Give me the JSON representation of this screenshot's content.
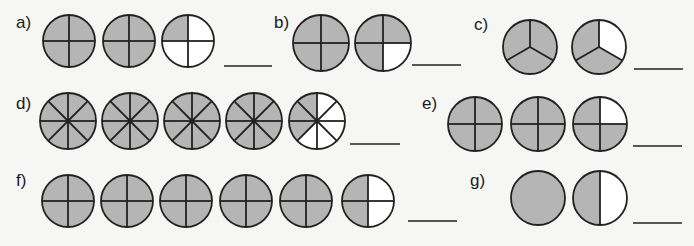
{
  "worksheet": {
    "colors": {
      "background": "#f6f6f4",
      "shaded": "#b5b5b5",
      "unshaded": "#ffffff",
      "line": "#222222"
    },
    "problems": [
      {
        "label": "a)",
        "label_pos": [
          16,
          14
        ],
        "radius": 26,
        "cy": 41,
        "circles": [
          {
            "cx": 69,
            "parts": 4,
            "shaded": [
              0,
              1,
              2,
              3
            ]
          },
          {
            "cx": 129,
            "parts": 4,
            "shaded": [
              0,
              1,
              2,
              3
            ]
          },
          {
            "cx": 188,
            "parts": 4,
            "shaded": [
              3
            ]
          }
        ],
        "answer_line": {
          "x1": 224,
          "x2": 272,
          "y": 66
        },
        "answer": ""
      },
      {
        "label": "b)",
        "label_pos": [
          274,
          14
        ],
        "radius": 28,
        "cy": 43,
        "circles": [
          {
            "cx": 321,
            "parts": 4,
            "shaded": [
              0,
              1,
              2,
              3
            ]
          },
          {
            "cx": 383,
            "parts": 4,
            "shaded": [
              0,
              2,
              3
            ]
          }
        ],
        "answer_line": {
          "x1": 412,
          "x2": 461,
          "y": 65
        },
        "answer": ""
      },
      {
        "label": "c)",
        "label_pos": [
          474,
          16
        ],
        "radius": 27,
        "cy": 47,
        "circles": [
          {
            "cx": 530,
            "parts": 3,
            "shaded": [
              0,
              1,
              2
            ]
          },
          {
            "cx": 599,
            "parts": 3,
            "shaded": [
              1,
              2
            ]
          }
        ],
        "answer_line": {
          "x1": 634,
          "x2": 683,
          "y": 69
        },
        "answer": ""
      },
      {
        "label": "d)",
        "label_pos": [
          16,
          95
        ],
        "radius": 28,
        "cy": 121,
        "circles": [
          {
            "cx": 68,
            "parts": 8,
            "shaded": [
              0,
              1,
              2,
              3,
              4,
              5,
              6,
              7
            ]
          },
          {
            "cx": 130,
            "parts": 8,
            "shaded": [
              0,
              1,
              2,
              3,
              4,
              5,
              6,
              7
            ]
          },
          {
            "cx": 192,
            "parts": 8,
            "shaded": [
              0,
              1,
              2,
              3,
              4,
              5,
              6,
              7
            ]
          },
          {
            "cx": 254,
            "parts": 8,
            "shaded": [
              0,
              1,
              2,
              3,
              4,
              5,
              6,
              7
            ]
          },
          {
            "cx": 317,
            "parts": 8,
            "shaded": [
              5,
              6,
              7
            ]
          }
        ],
        "answer_line": {
          "x1": 350,
          "x2": 400,
          "y": 144
        },
        "answer": ""
      },
      {
        "label": "e)",
        "label_pos": [
          422,
          95
        ],
        "radius": 27,
        "cy": 124,
        "circles": [
          {
            "cx": 475,
            "parts": 4,
            "shaded": [
              0,
              1,
              2,
              3
            ]
          },
          {
            "cx": 538,
            "parts": 4,
            "shaded": [
              0,
              1,
              2,
              3
            ]
          },
          {
            "cx": 600,
            "parts": 4,
            "shaded": [
              1,
              2,
              3
            ]
          }
        ],
        "answer_line": {
          "x1": 633,
          "x2": 682,
          "y": 146
        },
        "answer": ""
      },
      {
        "label": "f)",
        "label_pos": [
          16,
          172
        ],
        "radius": 26,
        "cy": 201,
        "circles": [
          {
            "cx": 68,
            "parts": 4,
            "shaded": [
              0,
              1,
              2,
              3
            ]
          },
          {
            "cx": 127,
            "parts": 4,
            "shaded": [
              0,
              1,
              2,
              3
            ]
          },
          {
            "cx": 186,
            "parts": 4,
            "shaded": [
              0,
              1,
              2,
              3
            ]
          },
          {
            "cx": 246,
            "parts": 4,
            "shaded": [
              0,
              1,
              2,
              3
            ]
          },
          {
            "cx": 306,
            "parts": 4,
            "shaded": [
              0,
              1,
              2,
              3
            ]
          },
          {
            "cx": 368,
            "parts": 4,
            "shaded": [
              2,
              3
            ]
          }
        ],
        "answer_line": {
          "x1": 408,
          "x2": 457,
          "y": 221
        },
        "answer": ""
      },
      {
        "label": "g)",
        "label_pos": [
          470,
          172
        ],
        "radius": 27,
        "cy": 198,
        "circles": [
          {
            "cx": 538,
            "parts": 1,
            "shaded": [
              0
            ]
          },
          {
            "cx": 600,
            "parts": 2,
            "shaded": [
              1
            ]
          }
        ],
        "answer_line": {
          "x1": 633,
          "x2": 682,
          "y": 223
        },
        "answer": ""
      }
    ]
  }
}
